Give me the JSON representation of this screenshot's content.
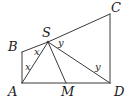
{
  "figure": {
    "type": "geometry-diagram",
    "stroke_color": "#3a3a3a",
    "label_color": "#1a1a1a",
    "background_color": "#ffffff",
    "width": 131,
    "height": 104,
    "points": [
      {
        "name": "A",
        "label": "A",
        "x": 22,
        "y": 83,
        "label_x": 8,
        "label_y": 85
      },
      {
        "name": "B",
        "label": "B",
        "x": 22,
        "y": 52,
        "label_x": 8,
        "label_y": 40
      },
      {
        "name": "C",
        "label": "C",
        "x": 110,
        "y": 14,
        "label_x": 111,
        "label_y": 1
      },
      {
        "name": "D",
        "label": "D",
        "x": 110,
        "y": 83,
        "label_x": 114,
        "label_y": 85
      },
      {
        "name": "S",
        "label": "S",
        "x": 48,
        "y": 42,
        "label_x": 42,
        "label_y": 26
      },
      {
        "name": "M",
        "label": "M",
        "x": 66,
        "y": 83,
        "label_x": 61,
        "label_y": 85
      }
    ],
    "segments": [
      {
        "name": "segment-AB",
        "from": "A",
        "to": "B"
      },
      {
        "name": "segment-BS",
        "from": "B",
        "to": "S"
      },
      {
        "name": "segment-SC",
        "from": "S",
        "to": "C"
      },
      {
        "name": "segment-CD",
        "from": "C",
        "to": "D"
      },
      {
        "name": "segment-AD",
        "from": "A",
        "to": "D"
      },
      {
        "name": "segment-SA",
        "from": "S",
        "to": "A"
      },
      {
        "name": "segment-SM",
        "from": "S",
        "to": "M"
      },
      {
        "name": "segment-SD",
        "from": "S",
        "to": "D"
      }
    ],
    "angle_labels": [
      {
        "name": "angle-x-at-S",
        "text": "x",
        "x": 34,
        "y": 47
      },
      {
        "name": "angle-x-at-A",
        "text": "x",
        "x": 25,
        "y": 62
      },
      {
        "name": "angle-y-at-S",
        "text": "y",
        "x": 58,
        "y": 38
      },
      {
        "name": "angle-y-at-D",
        "text": "y",
        "x": 95,
        "y": 62
      }
    ]
  }
}
